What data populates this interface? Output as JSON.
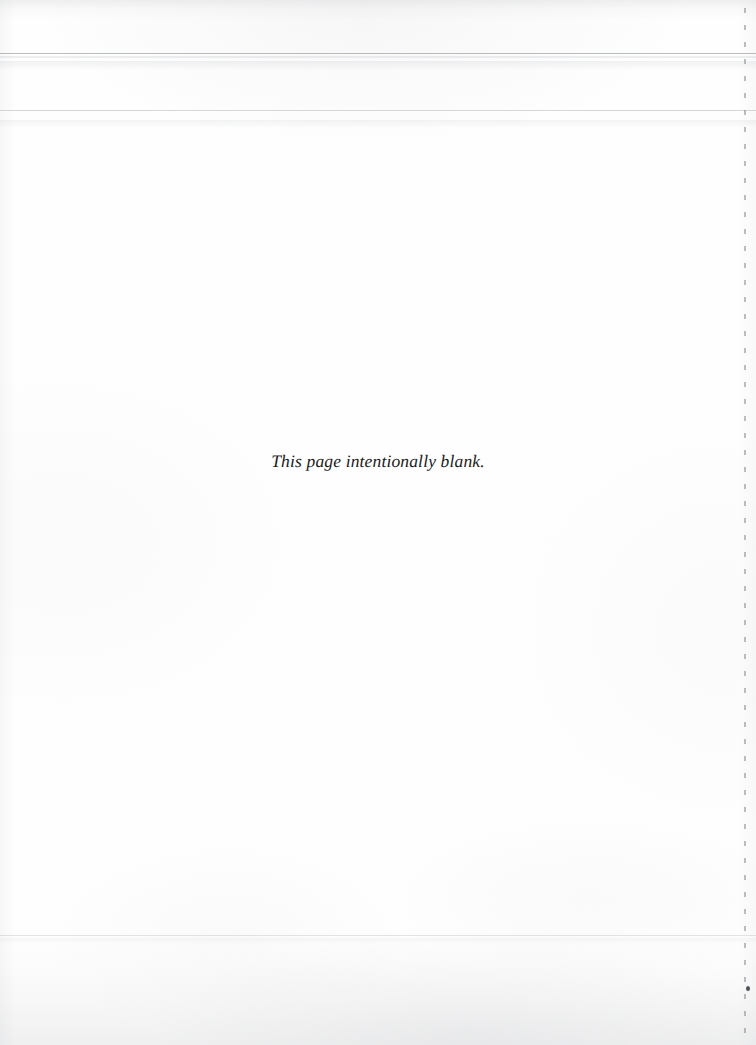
{
  "document": {
    "kind": "scanned-page",
    "page_width_px": 756,
    "page_height_px": 1045,
    "paper_color": "#fefefe",
    "ink_color": "#1a1a1c"
  },
  "content": {
    "blank_notice": "This page intentionally blank."
  },
  "artifacts": {
    "scan_rule_primary": "",
    "scan_rule_secondary": "",
    "scan_band_upper": "",
    "scan_rule_tertiary": "",
    "scan_band_lower": "",
    "scan_rule_footer": "",
    "scan_band_footer": "",
    "right_edge_dotted_line": "",
    "right_edge_wash": "",
    "edge_speck": "",
    "paper_texture": "",
    "edge_shading_top": "",
    "edge_shading_bottom": "",
    "edge_shading_left": ""
  }
}
